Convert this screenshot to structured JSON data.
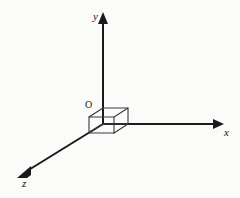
{
  "figure": {
    "type": "3d-coordinate-axes-diagram",
    "background_color": "#fbfbfa",
    "stroke_color": "#1a1a1a",
    "cube_stroke_color": "#3a3a3a",
    "origin_label": "O",
    "axes": [
      {
        "id": "y",
        "label": "y",
        "direction": "up",
        "start": [
          103,
          124
        ],
        "end": [
          103,
          16
        ],
        "arrow_at": [
          103,
          13
        ],
        "label_pos": [
          93,
          11
        ]
      },
      {
        "id": "x",
        "label": "x",
        "direction": "right",
        "start": [
          103,
          124
        ],
        "end": [
          219,
          124
        ],
        "arrow_at": [
          224,
          124
        ],
        "label_pos": [
          224,
          127
        ]
      },
      {
        "id": "z",
        "label": "z",
        "direction": "down-left",
        "start": [
          103,
          124
        ],
        "end": [
          26,
          172
        ],
        "arrow_at": [
          19,
          177
        ],
        "label_pos": [
          22,
          178
        ]
      }
    ],
    "cube": {
      "description": "small unit cube drawn at the origin",
      "front_top_right": [
        128,
        108
      ],
      "front_bottom_right": [
        128,
        124
      ],
      "origin": [
        103,
        124
      ],
      "top_front_left": [
        103,
        108
      ],
      "back_offset": [
        -14,
        9
      ]
    }
  }
}
